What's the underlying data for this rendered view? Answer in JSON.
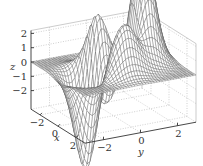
{
  "chart_data": {
    "type": "surface",
    "function": "peaks",
    "title": "",
    "xlabel": "x",
    "ylabel": "y",
    "zlabel": "z",
    "xlim": [
      -3,
      3
    ],
    "ylim": [
      -3,
      3
    ],
    "zlim": [
      -3.3,
      2.2
    ],
    "x_ticks": [
      -2,
      0,
      2
    ],
    "y_ticks": [
      -2,
      0,
      2
    ],
    "z_ticks": [
      -2,
      -1,
      0,
      1,
      2
    ],
    "x_tick_labels": [
      "−2",
      "0",
      "2"
    ],
    "y_tick_labels": [
      "−2",
      "0",
      "2"
    ],
    "z_tick_labels": [
      "−2",
      "−1",
      "0",
      "1",
      "2"
    ],
    "grid": true,
    "grid_style": "dotted",
    "mesh_resolution": 41,
    "surface_color": "#ffffff",
    "edge_color": "#555555",
    "axis_color": "#333333"
  }
}
